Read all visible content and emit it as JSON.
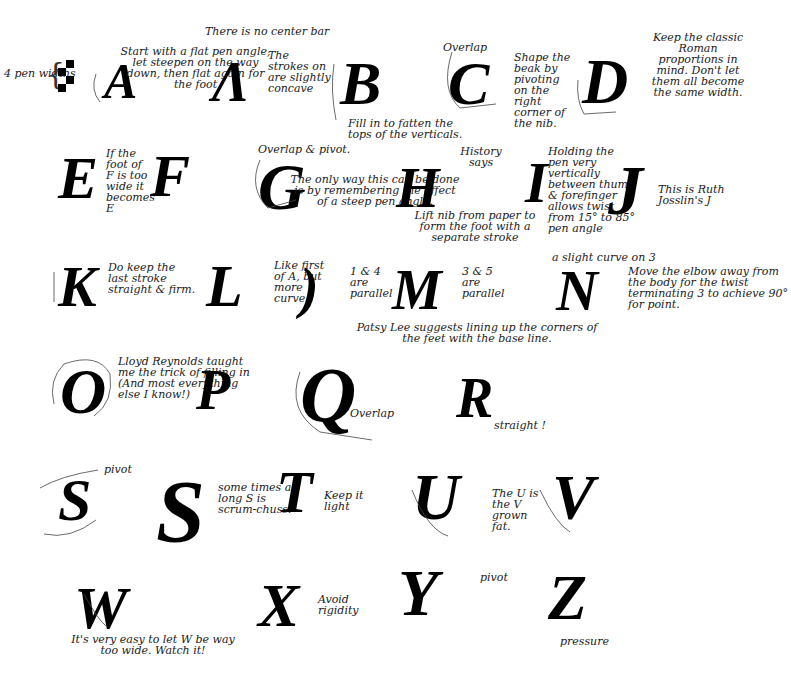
{
  "sheet": {
    "title_note": "There is no center bar",
    "pen_widths_label": "4 pen widths",
    "background": "#ffffff",
    "ink": "#000000"
  },
  "letters": [
    {
      "glyph": "A",
      "label": "letter-a-first-stroke",
      "notes": [
        "Start with a flat pen angle, let steepen on the way down, then flat again for the foot"
      ]
    },
    {
      "glyph": "Λ",
      "label": "letter-a",
      "notes": [
        "The strokes on are slightly concave"
      ]
    },
    {
      "glyph": "B",
      "label": "letter-b",
      "notes": [
        "Fill in to fatten the tops of the verticals."
      ]
    },
    {
      "glyph": "C",
      "label": "letter-c",
      "notes": [
        "Overlap",
        "Shape the beak by pivoting on the right corner of the nib."
      ]
    },
    {
      "glyph": "D",
      "label": "letter-d",
      "notes": [
        "Keep the classic Roman proportions in mind. Don't let them all become the same width."
      ]
    },
    {
      "glyph": "E",
      "label": "letter-e",
      "notes": [
        "If the foot of F is too wide it becomes E"
      ]
    },
    {
      "glyph": "F",
      "label": "letter-f",
      "notes": []
    },
    {
      "glyph": "G",
      "label": "letter-g",
      "notes": [
        "Overlap & pivot.",
        "The only way this can be done is by remembering the effect of a steep pen angle."
      ]
    },
    {
      "glyph": "H",
      "label": "letter-h",
      "notes": [
        "History says",
        "Lift nib from paper to form the foot with a separate stroke"
      ]
    },
    {
      "glyph": "I",
      "label": "letter-i",
      "notes": [
        "Holding the pen very vertically between thumb & forefinger allows twist from 15° to 85° pen angle"
      ]
    },
    {
      "glyph": "J",
      "label": "letter-j",
      "notes": [
        "This is Ruth Josslin's J"
      ]
    },
    {
      "glyph": "K",
      "label": "letter-k",
      "notes": [
        "Do keep the last stroke straight & firm."
      ]
    },
    {
      "glyph": "L",
      "label": "letter-l",
      "notes": []
    },
    {
      "glyph": ")",
      "label": "letter-m-first-stroke",
      "notes": [
        "Like first of A, but more curve"
      ]
    },
    {
      "glyph": "M",
      "label": "letter-m",
      "notes": [
        "1 & 4 are parallel",
        "3 & 5 are parallel"
      ]
    },
    {
      "glyph": "N",
      "label": "letter-n",
      "notes": [
        "a slight curve on 3",
        "Move the elbow away from the body for the twist terminating 3 to achieve 90° for point."
      ]
    },
    {
      "glyph": "O",
      "label": "letter-o",
      "notes": [
        "Patsy Lee suggests lining up the corners of the feet with the base line."
      ]
    },
    {
      "glyph": "P",
      "label": "letter-p",
      "notes": [
        "Lloyd Reynolds taught me the trick of filling in (And most everything else I know!)"
      ]
    },
    {
      "glyph": "Q",
      "label": "letter-q",
      "notes": [
        "Overlap"
      ]
    },
    {
      "glyph": "R",
      "label": "letter-r",
      "notes": [
        "straight !"
      ]
    },
    {
      "glyph": "S",
      "label": "letter-s",
      "notes": [
        "pivot"
      ]
    },
    {
      "glyph": "S",
      "label": "letter-long-s",
      "notes": [
        "some times a long S is scrum-chuss!"
      ]
    },
    {
      "glyph": "T",
      "label": "letter-t",
      "notes": [
        "Keep it light"
      ]
    },
    {
      "glyph": "U",
      "label": "letter-u",
      "notes": [
        "The U is the V grown fat."
      ]
    },
    {
      "glyph": "V",
      "label": "letter-v",
      "notes": []
    },
    {
      "glyph": "W",
      "label": "letter-w",
      "notes": [
        "It's very easy to let W be way too wide. Watch it!"
      ]
    },
    {
      "glyph": "X",
      "label": "letter-x",
      "notes": [
        "Avoid rigidity"
      ]
    },
    {
      "glyph": "Y",
      "label": "letter-y",
      "notes": [
        "pivot"
      ]
    },
    {
      "glyph": "Z",
      "label": "letter-z",
      "notes": [
        "pressure"
      ]
    }
  ]
}
